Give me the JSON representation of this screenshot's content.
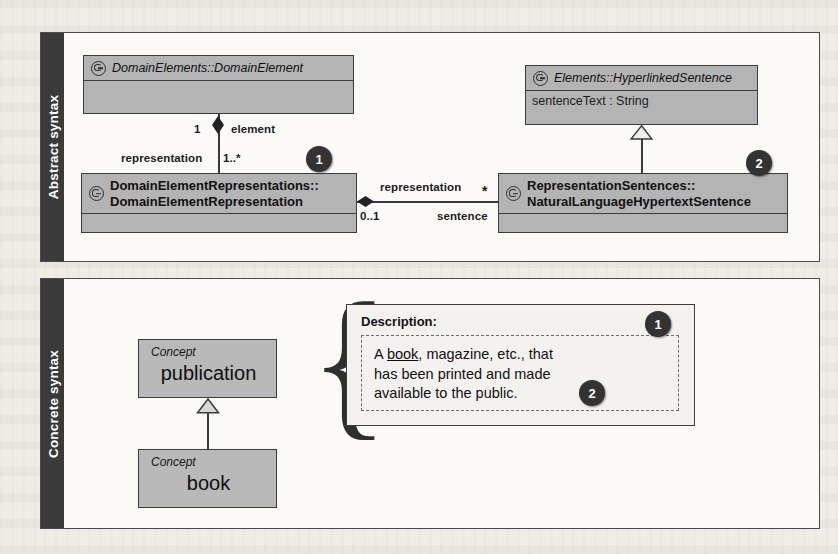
{
  "panels": {
    "abstract": {
      "label": "Abstract syntax",
      "classes": [
        {
          "icon": "uml-class-icon",
          "name": "DomainElements::DomainElement",
          "style": "italic",
          "attributes": []
        },
        {
          "icon": "uml-class-icon",
          "name_line1": "DomainElementRepresentations::",
          "name_line2": "DomainElementRepresentation",
          "style": "bold",
          "attributes": []
        },
        {
          "icon": "uml-class-icon",
          "name": "Elements::HyperlinkedSentence",
          "style": "italic",
          "attributes": [
            "sentenceText : String"
          ]
        },
        {
          "icon": "uml-class-icon",
          "name_line1": "RepresentationSentences::",
          "name_line2": "NaturalLanguageHypertextSentence",
          "style": "bold",
          "attributes": []
        }
      ],
      "edges": {
        "composition_vertical": {
          "end_multiplicity": "1",
          "end_role": "element",
          "start_role": "representation",
          "start_multiplicity": "1..*"
        },
        "composition_horizontal": {
          "start_role": "representation",
          "start_multiplicity": "0..1",
          "end_role": "sentence",
          "end_multiplicity": "*"
        }
      },
      "badges": [
        {
          "number": "1"
        },
        {
          "number": "2"
        }
      ]
    },
    "concrete": {
      "label": "Concrete syntax",
      "concepts": [
        {
          "stereotype": "Concept",
          "name": "publication"
        },
        {
          "stereotype": "Concept",
          "name": "book"
        }
      ],
      "description": {
        "title": "Description:",
        "text_line1_pre": "A ",
        "text_link": "book",
        "text_line1_post": ", magazine, etc., that",
        "text_line2": "has been printed and made",
        "text_line3": "available to the public."
      },
      "badges": [
        {
          "number": "1"
        },
        {
          "number": "2"
        }
      ]
    }
  },
  "colors": {
    "class_fill": "#b4b4b4",
    "class_border": "#3c3c3c",
    "panel_bg": "#fbfaf7",
    "sidebar_bg": "#3a3a3a",
    "badge_bg": "#333333"
  }
}
